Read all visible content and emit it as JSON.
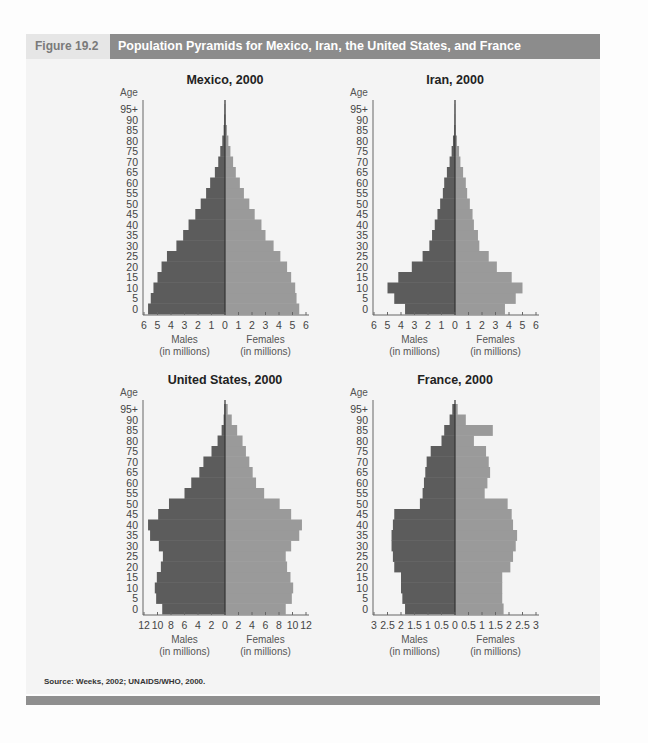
{
  "header": {
    "figure_label": "Figure 19.2",
    "title": "Population Pyramids for Mexico, Iran, the United States, and France"
  },
  "source": "Source: Weeks, 2002; UNAIDS/WHO, 2000.",
  "colors": {
    "males": "#5c5c5c",
    "females": "#9a9a9a",
    "title_bar": "#8c8c8c",
    "panel": "#f4f4f4"
  },
  "age_labels": [
    "0",
    "5",
    "10",
    "15",
    "20",
    "25",
    "30",
    "35",
    "40",
    "45",
    "50",
    "55",
    "60",
    "65",
    "70",
    "75",
    "80",
    "85",
    "90",
    "95+"
  ],
  "chart_data": [
    {
      "type": "bar",
      "orientation": "horizontal-pyramid",
      "title": "Mexico, 2000",
      "ylabel": "Age",
      "xlabel_left": "Males\n(in millions)",
      "xlabel_right": "Females\n(in millions)",
      "categories": [
        "0",
        "5",
        "10",
        "15",
        "20",
        "25",
        "30",
        "35",
        "40",
        "45",
        "50",
        "55",
        "60",
        "65",
        "70",
        "75",
        "80",
        "85",
        "90",
        "95+"
      ],
      "xticks": [
        "6",
        "5",
        "4",
        "3",
        "2",
        "1",
        "0",
        "1",
        "2",
        "3",
        "4",
        "5",
        "6"
      ],
      "xlim": [
        -6,
        6
      ],
      "series": [
        {
          "name": "Males",
          "values": [
            5.7,
            5.5,
            5.3,
            5.0,
            4.7,
            4.3,
            3.6,
            3.1,
            2.7,
            2.2,
            1.8,
            1.4,
            1.1,
            0.75,
            0.5,
            0.35,
            0.2,
            0.1,
            0.05,
            0.02
          ]
        },
        {
          "name": "Females",
          "values": [
            5.5,
            5.3,
            5.2,
            4.9,
            4.6,
            4.1,
            3.6,
            3.0,
            2.7,
            2.2,
            1.8,
            1.4,
            1.1,
            0.8,
            0.6,
            0.4,
            0.25,
            0.15,
            0.05,
            0.02
          ]
        }
      ]
    },
    {
      "type": "bar",
      "orientation": "horizontal-pyramid",
      "title": "Iran, 2000",
      "ylabel": "Age",
      "xlabel_left": "Males\n(in millions)",
      "xlabel_right": "Females\n(in millions)",
      "categories": [
        "0",
        "5",
        "10",
        "15",
        "20",
        "25",
        "30",
        "35",
        "40",
        "45",
        "50",
        "55",
        "60",
        "65",
        "70",
        "75",
        "80",
        "85",
        "90",
        "95+"
      ],
      "xticks": [
        "6",
        "5",
        "4",
        "3",
        "2",
        "1",
        "0",
        "1",
        "2",
        "3",
        "4",
        "5",
        "6"
      ],
      "xlim": [
        -6,
        6
      ],
      "series": [
        {
          "name": "Males",
          "values": [
            3.7,
            4.5,
            5.0,
            4.2,
            3.2,
            2.4,
            1.9,
            1.7,
            1.5,
            1.3,
            1.1,
            0.9,
            0.8,
            0.6,
            0.4,
            0.25,
            0.15,
            0.05,
            0.02,
            0.01
          ]
        },
        {
          "name": "Females",
          "values": [
            3.7,
            4.5,
            5.0,
            4.2,
            3.1,
            2.5,
            1.8,
            1.7,
            1.4,
            1.3,
            1.1,
            0.9,
            0.8,
            0.6,
            0.4,
            0.3,
            0.15,
            0.05,
            0.02,
            0.01
          ]
        }
      ]
    },
    {
      "type": "bar",
      "orientation": "horizontal-pyramid",
      "title": "United States, 2000",
      "ylabel": "Age",
      "xlabel_left": "Males\n(in millions)",
      "xlabel_right": "Females\n(in millions)",
      "categories": [
        "0",
        "5",
        "10",
        "15",
        "20",
        "25",
        "30",
        "35",
        "40",
        "45",
        "50",
        "55",
        "60",
        "65",
        "70",
        "75",
        "80",
        "85",
        "90",
        "95+"
      ],
      "xticks": [
        "12",
        "10",
        "8",
        "6",
        "4",
        "2",
        "0",
        "2",
        "4",
        "6",
        "8",
        "10",
        "12"
      ],
      "xlim": [
        -12,
        12
      ],
      "series": [
        {
          "name": "Males",
          "values": [
            9.3,
            10.2,
            10.4,
            10.1,
            9.5,
            9.2,
            9.8,
            11.1,
            11.4,
            9.9,
            8.3,
            6.0,
            5.0,
            3.8,
            3.2,
            2.0,
            1.1,
            0.5,
            0.2,
            0.1
          ]
        },
        {
          "name": "Females",
          "values": [
            9.0,
            9.9,
            10.1,
            9.7,
            9.2,
            9.0,
            9.8,
            11.0,
            11.4,
            9.8,
            8.1,
            5.8,
            4.6,
            4.1,
            3.6,
            3.1,
            2.6,
            1.8,
            1.0,
            0.4
          ]
        }
      ]
    },
    {
      "type": "bar",
      "orientation": "horizontal-pyramid",
      "title": "France, 2000",
      "ylabel": "Age",
      "xlabel_left": "Males\n(in millions)",
      "xlabel_right": "Females\n(in millions)",
      "categories": [
        "0",
        "5",
        "10",
        "15",
        "20",
        "25",
        "30",
        "35",
        "40",
        "45",
        "50",
        "55",
        "60",
        "65",
        "70",
        "75",
        "80",
        "85",
        "90",
        "95+"
      ],
      "xticks": [
        "3",
        "2.5",
        "2",
        "1.5",
        "1",
        "0.5",
        "0",
        "0.5",
        "1",
        "1.5",
        "2",
        "2.5",
        "3"
      ],
      "xlim": [
        -3,
        3
      ],
      "series": [
        {
          "name": "Males",
          "values": [
            1.85,
            1.95,
            2.0,
            2.0,
            2.25,
            2.3,
            2.35,
            2.35,
            2.3,
            2.25,
            1.3,
            1.2,
            1.15,
            1.1,
            1.05,
            0.9,
            0.5,
            0.4,
            0.2,
            0.1
          ]
        },
        {
          "name": "Females",
          "values": [
            1.8,
            1.75,
            1.75,
            1.75,
            2.05,
            2.15,
            2.25,
            2.3,
            2.15,
            2.1,
            1.95,
            1.1,
            1.2,
            1.3,
            1.25,
            1.15,
            0.7,
            1.4,
            0.4,
            0.1
          ]
        }
      ]
    }
  ]
}
